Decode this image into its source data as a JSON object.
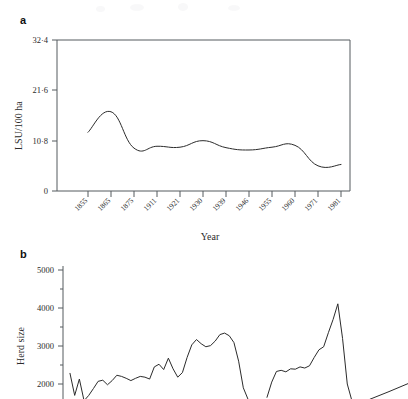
{
  "figure": {
    "background": "#ffffff",
    "line_color": "#2b2b2b",
    "axis_color": "#555a5e"
  },
  "panels": {
    "a": {
      "label": "a",
      "ylabel": "LSU/100 ha",
      "xlabel": "Year",
      "frame": {
        "left": 57,
        "top": 40,
        "right": 350,
        "bottom": 191
      }
    },
    "b": {
      "label": "b",
      "ylabel": "Herd size",
      "xlabel": "",
      "frame": {
        "left": 63,
        "top": 266,
        "right": 408,
        "bottom": 399
      }
    }
  },
  "chart_data": [
    {
      "type": "line",
      "panel": "a",
      "title": "",
      "xlabel": "Year",
      "ylabel": "LSU/100 ha",
      "categories": [
        "1855",
        "1865",
        "1875",
        "1911",
        "1921",
        "1930",
        "1939",
        "1946",
        "1955",
        "1960",
        "1971",
        "1981"
      ],
      "ytick_labels": [
        "0",
        "10·8",
        "21·6",
        "32·4"
      ],
      "ytick_values": [
        0,
        10.8,
        21.6,
        32.4
      ],
      "ylim": [
        0,
        32.4
      ],
      "grid": false,
      "legend": "none",
      "xtick_label_rotation": 45,
      "values": [
        12.6,
        17.0,
        9.2,
        9.6,
        9.4,
        10.8,
        9.3,
        8.8,
        9.4,
        9.8,
        5.4,
        5.7
      ],
      "series": [
        {
          "name": "Livestock units per 100 ha",
          "values": [
            12.6,
            17.0,
            9.2,
            9.6,
            9.4,
            10.8,
            9.3,
            8.8,
            9.4,
            9.8,
            5.4,
            5.7
          ]
        }
      ]
    },
    {
      "type": "line",
      "panel": "b",
      "title": "",
      "xlabel": "",
      "ylabel": "Herd size",
      "ytick_labels": [
        "2000",
        "3000",
        "4000",
        "5000"
      ],
      "ytick_values": [
        2000,
        3000,
        4000,
        5000
      ],
      "ylim": [
        1500,
        5200
      ],
      "grid": false,
      "legend": "none",
      "note_cropped_bottom": true,
      "series": [
        {
          "name": "Herd size segment 1",
          "values": [
            2280,
            1700,
            2130,
            1560,
            1700,
            1880,
            2070,
            2100,
            1980,
            2090,
            2230,
            2200,
            2150,
            2090,
            2150,
            2200,
            2180,
            2130,
            2450,
            2520,
            2380,
            2680,
            2400,
            2180,
            2300,
            2700,
            3030,
            3170,
            3060,
            2980,
            3010,
            3130,
            3300,
            3340,
            3270,
            3090,
            2600,
            1900,
            1600
          ]
        },
        {
          "name": "Herd size segment 2",
          "values": [
            1650,
            2050,
            2330,
            2360,
            2320,
            2400,
            2390,
            2450,
            2420,
            2480,
            2700,
            2900,
            2980,
            3350,
            3700,
            4110,
            3200,
            2000,
            1550
          ]
        },
        {
          "name": "Herd size segment 3",
          "values": [
            1600,
            1800,
            2010
          ]
        }
      ]
    }
  ]
}
